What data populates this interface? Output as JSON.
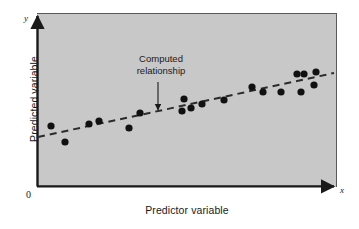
{
  "figure": {
    "name": "scatter-plot-regression",
    "plot_background_color": "#c6c6c6",
    "frame_color": "#1a1a1a",
    "point_color": "#111111",
    "trend_line_color": "#2b2b2b",
    "page_background_color": "#ffffff",
    "plot_area": {
      "x": 37,
      "y": 13,
      "width": 300,
      "height": 174
    }
  },
  "axes": {
    "x_title": "Predictor variable",
    "y_title": "Predicted variable",
    "x_tip_letter": "x",
    "y_tip_letter": "y",
    "origin_label": "0"
  },
  "annotation": {
    "line1": "Computed",
    "line2": "relationship",
    "arrow_from": {
      "x": 158,
      "y": 82
    },
    "arrow_to": {
      "x": 158,
      "y": 111
    }
  },
  "chart_data": {
    "type": "scatter",
    "title": "",
    "xlabel": "Predictor variable",
    "ylabel": "Predicted variable",
    "xlim": [
      0,
      100
    ],
    "ylim": [
      0,
      100
    ],
    "grid": false,
    "legend": null,
    "annotations": [
      {
        "text": "Computed relationship",
        "points_to": "trend-line",
        "x": 40.5,
        "y": 62
      }
    ],
    "series": [
      {
        "name": "observations",
        "marker": "filled-circle",
        "color": "#111111",
        "points": [
          {
            "px": 51,
            "py": 126,
            "x": 4.7,
            "y": 35.1
          },
          {
            "px": 65,
            "py": 142,
            "x": 9.3,
            "y": 25.9
          },
          {
            "px": 89,
            "py": 124,
            "x": 17.3,
            "y": 36.2
          },
          {
            "px": 99,
            "py": 121,
            "x": 20.7,
            "y": 37.9
          },
          {
            "px": 129,
            "py": 128,
            "x": 30.7,
            "y": 33.9
          },
          {
            "px": 140,
            "py": 113,
            "x": 34.3,
            "y": 42.5
          },
          {
            "px": 184,
            "py": 99,
            "x": 49.0,
            "y": 50.6
          },
          {
            "px": 182,
            "py": 111,
            "x": 48.3,
            "y": 43.7
          },
          {
            "px": 191,
            "py": 108,
            "x": 51.3,
            "y": 45.4
          },
          {
            "px": 202,
            "py": 104,
            "x": 55.0,
            "y": 47.7
          },
          {
            "px": 224,
            "py": 100,
            "x": 62.3,
            "y": 50.0
          },
          {
            "px": 252,
            "py": 87,
            "x": 71.7,
            "y": 57.5
          },
          {
            "px": 263,
            "py": 92,
            "x": 75.3,
            "y": 54.6
          },
          {
            "px": 281,
            "py": 92,
            "x": 81.3,
            "y": 54.6
          },
          {
            "px": 297,
            "py": 74,
            "x": 86.7,
            "y": 64.9
          },
          {
            "px": 304,
            "py": 74,
            "x": 89.0,
            "y": 64.9
          },
          {
            "px": 301,
            "py": 92,
            "x": 88.0,
            "y": 54.6
          },
          {
            "px": 314,
            "py": 85,
            "x": 92.3,
            "y": 58.6
          },
          {
            "px": 316,
            "py": 72,
            "x": 93.0,
            "y": 66.1
          }
        ]
      }
    ],
    "trend_line": {
      "name": "Computed relationship",
      "style": "dashed",
      "color": "#2b2b2b",
      "px_start": {
        "x": 38,
        "y": 137
      },
      "px_end": {
        "x": 334,
        "y": 73
      },
      "x_range": [
        0.3,
        99.0
      ],
      "y_range": [
        28.7,
        65.5
      ]
    }
  }
}
